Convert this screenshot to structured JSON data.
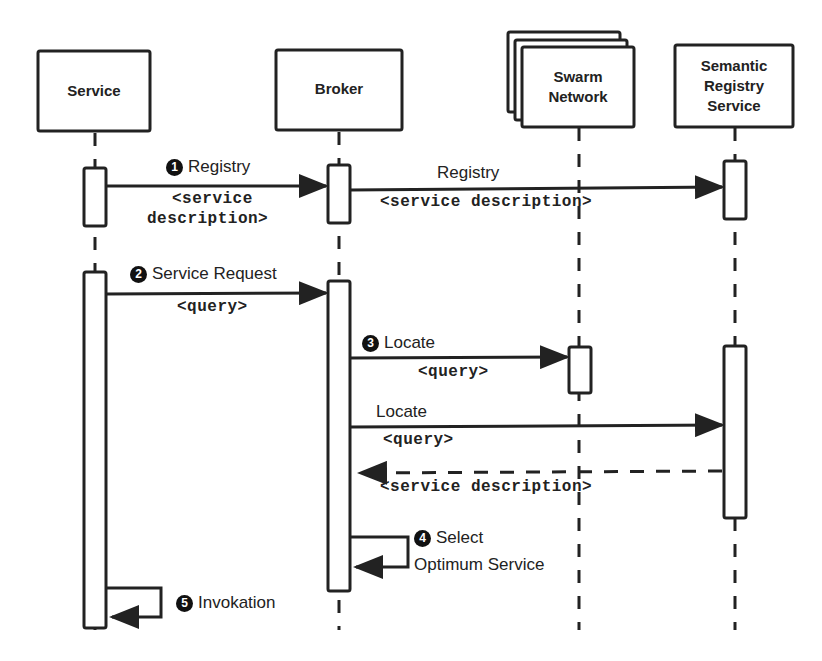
{
  "participants": [
    {
      "id": "service",
      "label": "Service"
    },
    {
      "id": "broker",
      "label": "Broker"
    },
    {
      "id": "swarm",
      "label": "Swarm Network"
    },
    {
      "id": "registry",
      "label": "Semantic Registry Service"
    }
  ],
  "participant_lines": {
    "swarm": [
      "Swarm",
      "Network"
    ],
    "registry": [
      "Semantic",
      "Registry",
      "Service"
    ]
  },
  "messages": [
    {
      "step": "1",
      "label": "Registry",
      "payload_line1": "<service",
      "payload_line2": "description>"
    },
    {
      "step": "",
      "label": "Registry",
      "payload": "<service description>"
    },
    {
      "step": "2",
      "label": "Service Request",
      "payload": "<query>"
    },
    {
      "step": "3",
      "label": "Locate",
      "payload": "<query>"
    },
    {
      "step": "",
      "label": "Locate",
      "payload": "<query>"
    },
    {
      "step": "",
      "label": "",
      "payload": "<service description>",
      "style": "dashed-return"
    },
    {
      "step": "4",
      "label": "Select",
      "label_line2": "Optimum Service"
    },
    {
      "step": "5",
      "label": "Invokation"
    }
  ]
}
